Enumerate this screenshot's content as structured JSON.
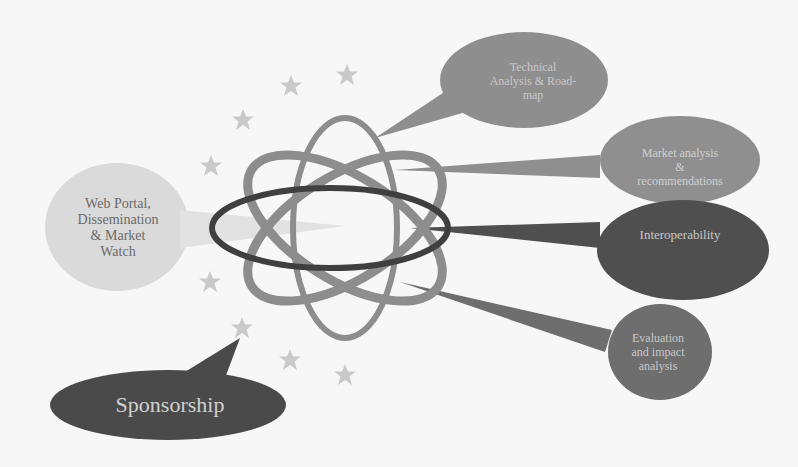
{
  "diagram": {
    "center": {
      "name": "atom-symbol"
    },
    "callouts": [
      {
        "id": "web-portal",
        "label": "Web Portal,\nDissemination\n& Market\nWatch",
        "fill": "#dadada"
      },
      {
        "id": "technical",
        "label": "Technical\nAnalysis & Road-\nmap",
        "fill": "#8e8e8e"
      },
      {
        "id": "market",
        "label": "Market analysis\n&\nrecommendations",
        "fill": "#8f8f8f"
      },
      {
        "id": "interop",
        "label": "Interoperability",
        "fill": "#4f4f4f"
      },
      {
        "id": "evaluation",
        "label": "Evaluation\nand impact\nanalysis",
        "fill": "#6e6e6e"
      },
      {
        "id": "sponsorship",
        "label": "Sponsorship",
        "fill": "#4a4a4a"
      }
    ],
    "stars_count": 9,
    "colors": {
      "background": "#f7f7f7",
      "star": "#c9c9c9",
      "orbit_light": "#8d8d8d",
      "orbit_dark": "#3f3f3f"
    }
  }
}
